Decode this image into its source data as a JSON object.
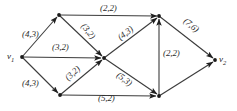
{
  "figure": {
    "kind": "directed-network-flow-graph",
    "background_color": "#ffffff",
    "stroke_color": "#3b3b3b",
    "label_color": "#2b2b2b",
    "width": 237,
    "height": 111
  },
  "nodes": [
    {
      "id": "v1",
      "label": "v",
      "subscript": "1",
      "x": 22,
      "y": 57,
      "label_x": 7,
      "label_y": 51
    },
    {
      "id": "a",
      "label": "",
      "subscript": "",
      "x": 59,
      "y": 15,
      "label_x": 0,
      "label_y": 0
    },
    {
      "id": "b",
      "label": "",
      "subscript": "",
      "x": 60,
      "y": 95,
      "label_x": 0,
      "label_y": 0
    },
    {
      "id": "c",
      "label": "",
      "subscript": "",
      "x": 104,
      "y": 58,
      "label_x": 0,
      "label_y": 0
    },
    {
      "id": "d",
      "label": "",
      "subscript": "",
      "x": 159,
      "y": 16,
      "label_x": 0,
      "label_y": 0
    },
    {
      "id": "e",
      "label": "",
      "subscript": "",
      "x": 159,
      "y": 96,
      "label_x": 0,
      "label_y": 0
    },
    {
      "id": "v2",
      "label": "v",
      "subscript": "2",
      "x": 215,
      "y": 60,
      "label_x": 219,
      "label_y": 54
    }
  ],
  "edges": [
    {
      "id": "v1-a",
      "from": "v1",
      "to": "a",
      "capacity": 4,
      "flow": 3,
      "label": "(4,3)",
      "label_x": 22,
      "label_y": 29,
      "rotate": 0
    },
    {
      "id": "v1-b",
      "from": "v1",
      "to": "b",
      "capacity": 4,
      "flow": 3,
      "label": "(4,3)",
      "label_x": 22,
      "label_y": 78,
      "rotate": 0
    },
    {
      "id": "v1-c",
      "from": "v1",
      "to": "c",
      "capacity": 3,
      "flow": 2,
      "label": "(3,2)",
      "label_x": 52,
      "label_y": 42,
      "rotate": 0
    },
    {
      "id": "a-d",
      "from": "a",
      "to": "d",
      "capacity": 2,
      "flow": 2,
      "label": "(2,2)",
      "label_x": 100,
      "label_y": 3,
      "rotate": 0
    },
    {
      "id": "a-c",
      "from": "a",
      "to": "c",
      "capacity": 3,
      "flow": 2,
      "label": "(3,2)",
      "label_x": 80,
      "label_y": 26,
      "rotate": 52
    },
    {
      "id": "b-c",
      "from": "b",
      "to": "c",
      "capacity": 3,
      "flow": 2,
      "label": "(3,2)",
      "label_x": 64,
      "label_y": 68,
      "rotate": -43
    },
    {
      "id": "c-d",
      "from": "c",
      "to": "d",
      "capacity": 4,
      "flow": 3,
      "label": "(4,3)",
      "label_x": 117,
      "label_y": 28,
      "rotate": -37
    },
    {
      "id": "c-e",
      "from": "c",
      "to": "e",
      "capacity": 5,
      "flow": 3,
      "label": "(5,3)",
      "label_x": 116,
      "label_y": 74,
      "rotate": 37
    },
    {
      "id": "b-e",
      "from": "b",
      "to": "e",
      "capacity": 5,
      "flow": 2,
      "label": "(5,2)",
      "label_x": 98,
      "label_y": 93,
      "rotate": 0
    },
    {
      "id": "e-d",
      "from": "e",
      "to": "d",
      "capacity": 2,
      "flow": 2,
      "label": "(2,2)",
      "label_x": 163,
      "label_y": 48,
      "rotate": 0
    },
    {
      "id": "d-v2",
      "from": "d",
      "to": "v2",
      "capacity": 7,
      "flow": 6,
      "label": "(7,6)",
      "label_x": 183,
      "label_y": 20,
      "rotate": 40
    }
  ],
  "legend": {
    "note": "Each edge label shows (capacity, flow)."
  }
}
